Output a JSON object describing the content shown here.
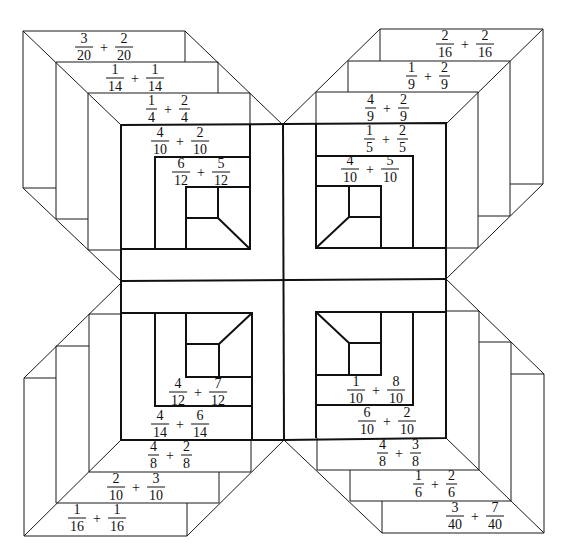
{
  "diagram": {
    "quadrants": {
      "top_left": {
        "labels": [
          {
            "id": "tl1",
            "a_num": "3",
            "a_den": "20",
            "op": "+",
            "b_num": "2",
            "b_den": "20"
          },
          {
            "id": "tl2",
            "a_num": "1",
            "a_den": "14",
            "op": "+",
            "b_num": "1",
            "b_den": "14"
          },
          {
            "id": "tl3",
            "a_num": "1",
            "a_den": "4",
            "op": "+",
            "b_num": "2",
            "b_den": "4"
          },
          {
            "id": "tl4",
            "a_num": "4",
            "a_den": "10",
            "op": "+",
            "b_num": "2",
            "b_den": "10"
          },
          {
            "id": "tl5",
            "a_num": "6",
            "a_den": "12",
            "op": "+",
            "b_num": "5",
            "b_den": "12"
          }
        ]
      },
      "top_right": {
        "labels": [
          {
            "id": "tr1",
            "a_num": "2",
            "a_den": "16",
            "op": "+",
            "b_num": "2",
            "b_den": "16"
          },
          {
            "id": "tr2",
            "a_num": "1",
            "a_den": "9",
            "op": "+",
            "b_num": "2",
            "b_den": "9"
          },
          {
            "id": "tr3",
            "a_num": "4",
            "a_den": "9",
            "op": "+",
            "b_num": "2",
            "b_den": "9"
          },
          {
            "id": "tr4",
            "a_num": "1",
            "a_den": "5",
            "op": "+",
            "b_num": "2",
            "b_den": "5"
          },
          {
            "id": "tr5",
            "a_num": "4",
            "a_den": "10",
            "op": "+",
            "b_num": "5",
            "b_den": "10"
          }
        ]
      },
      "bottom_left": {
        "labels": [
          {
            "id": "bl1",
            "a_num": "4",
            "a_den": "12",
            "op": "+",
            "b_num": "7",
            "b_den": "12"
          },
          {
            "id": "bl2",
            "a_num": "4",
            "a_den": "14",
            "op": "+",
            "b_num": "6",
            "b_den": "14"
          },
          {
            "id": "bl3",
            "a_num": "4",
            "a_den": "8",
            "op": "+",
            "b_num": "2",
            "b_den": "8"
          },
          {
            "id": "bl4",
            "a_num": "2",
            "a_den": "10",
            "op": "+",
            "b_num": "3",
            "b_den": "10"
          },
          {
            "id": "bl5",
            "a_num": "1",
            "a_den": "16",
            "op": "+",
            "b_num": "1",
            "b_den": "16"
          }
        ]
      },
      "bottom_right": {
        "labels": [
          {
            "id": "br1",
            "a_num": "1",
            "a_den": "10",
            "op": "+",
            "b_num": "8",
            "b_den": "10"
          },
          {
            "id": "br2",
            "a_num": "6",
            "a_den": "10",
            "op": "+",
            "b_num": "2",
            "b_den": "10"
          },
          {
            "id": "br3",
            "a_num": "4",
            "a_den": "8",
            "op": "+",
            "b_num": "3",
            "b_den": "8"
          },
          {
            "id": "br4",
            "a_num": "1",
            "a_den": "6",
            "op": "+",
            "b_num": "2",
            "b_den": "6"
          },
          {
            "id": "br5",
            "a_num": "3",
            "a_den": "40",
            "op": "+",
            "b_num": "7",
            "b_den": "40"
          }
        ]
      }
    }
  }
}
